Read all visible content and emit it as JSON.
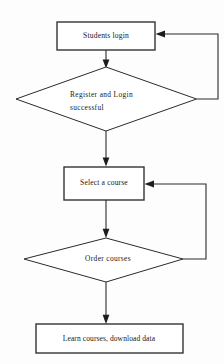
{
  "diagram": {
    "background_color": "#fdfdfd",
    "line_color": "#2b2b2b",
    "text_color": "#171717"
  },
  "nodes": {
    "students_login": {
      "label": "Students login",
      "type": "process"
    },
    "register_login_successful": {
      "label_line1": "Register  and  Login",
      "label_line2": "successful",
      "type": "decision"
    },
    "select_a_course": {
      "label": "Select a course",
      "type": "process"
    },
    "order_courses": {
      "label": "Order courses",
      "type": "decision"
    },
    "learn_courses": {
      "label": "Learn courses, download data",
      "type": "process"
    }
  },
  "connectors": {
    "login_to_register": "arrow down from Students login to Register and Login successful",
    "register_to_select": "arrow down from Register and Login successful to Select a course",
    "register_back_to_login": "feedback loop from Register and Login successful right vertex back to Students login",
    "select_to_order": "arrow down from Select a course to Order courses",
    "order_back_to_select": "feedback loop from Order courses right vertex back to Select a course",
    "order_to_learn": "arrow down from Order courses to Learn courses, download data"
  }
}
